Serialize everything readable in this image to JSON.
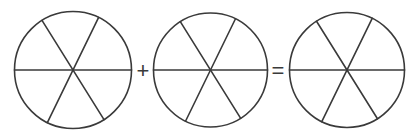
{
  "diagram": {
    "stroke_color": "#3a3a3a",
    "background": "#ffffff",
    "circles": [
      {
        "id": "circle-1",
        "cx": 73,
        "cy": 70,
        "r": 58.5,
        "sectors": 6
      },
      {
        "id": "circle-2",
        "cx": 210.5,
        "cy": 70,
        "r": 57,
        "sectors": 6
      },
      {
        "id": "circle-3",
        "cx": 347,
        "cy": 70,
        "r": 57.5,
        "sectors": 6
      }
    ],
    "spoke_angles_deg": [
      0,
      64,
      122
    ],
    "operators": [
      {
        "symbol": "+",
        "x": 143,
        "y": 71
      },
      {
        "symbol": "=",
        "x": 278,
        "y": 71
      }
    ]
  }
}
